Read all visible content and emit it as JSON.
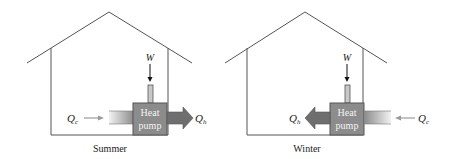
{
  "diagrams": [
    {
      "id": "summer",
      "caption": "Summer",
      "work_label": "W",
      "pump_line1": "Heat",
      "pump_line2": "pump",
      "cold_label": "Q",
      "cold_sub": "c",
      "hot_label": "Q",
      "hot_sub": "h",
      "flow_direction": "heat moved from inside to outside"
    },
    {
      "id": "winter",
      "caption": "Winter",
      "work_label": "W",
      "pump_line1": "Heat",
      "pump_line2": "pump",
      "cold_label": "Q",
      "cold_sub": "c",
      "hot_label": "Q",
      "hot_sub": "h",
      "flow_direction": "heat moved from outside to inside"
    }
  ],
  "colors": {
    "line": "#555555",
    "pump_fill": "#8c8c8c",
    "pump_border": "#555555",
    "hot_arrow": "#6e6e6e",
    "cold_arrow": "#a9a9a9"
  }
}
